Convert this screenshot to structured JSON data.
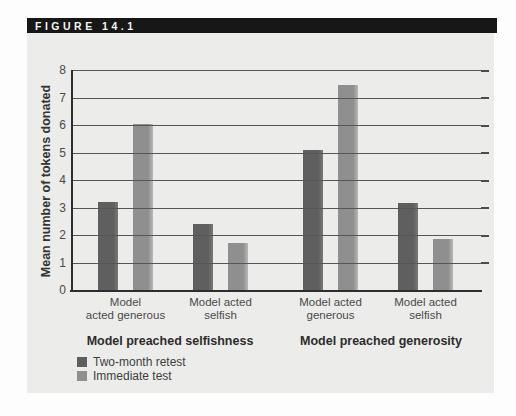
{
  "figure": {
    "label": "FIGURE 14.1"
  },
  "chart_data": {
    "type": "bar",
    "title": "",
    "ylabel": "Mean number of tokens donated",
    "xlabel": "",
    "ylim": [
      0,
      8
    ],
    "yticks": [
      "0",
      "1",
      "2",
      "3",
      "4",
      "5",
      "6",
      "7",
      "8"
    ],
    "grid": true,
    "legend_position": "bottom-left",
    "group_conditions": [
      "Model preached selfishness",
      "Model preached generosity"
    ],
    "categories": [
      {
        "lines": [
          "Model",
          "acted generous"
        ],
        "condition": 0
      },
      {
        "lines": [
          "Model acted",
          "selfish"
        ],
        "condition": 0
      },
      {
        "lines": [
          "Model acted",
          "generous"
        ],
        "condition": 1
      },
      {
        "lines": [
          "Model acted",
          "selfish"
        ],
        "condition": 1
      }
    ],
    "series": [
      {
        "name": "Two-month retest",
        "color": "#5f5f5f",
        "highlight": "#787878",
        "values": [
          3.2,
          2.4,
          5.1,
          3.15
        ]
      },
      {
        "name": "Immediate test",
        "color": "#8f8f8f",
        "highlight": "#b9b9b9",
        "values": [
          6.05,
          1.7,
          7.45,
          1.85
        ]
      }
    ],
    "colors": {
      "figure_header_bg": "#171717",
      "figure_header_text": "#f4f4f4",
      "figure_panel_bg": "#ececea",
      "gridline": "#565656",
      "axis": "#2d2d2d"
    }
  }
}
